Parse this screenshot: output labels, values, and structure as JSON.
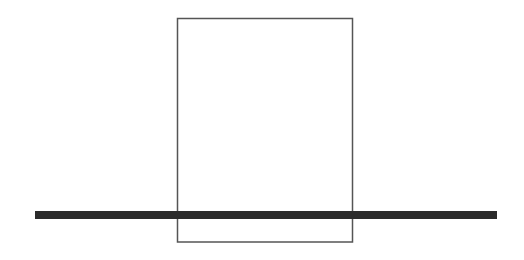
{
  "canvas": {
    "width": 524,
    "height": 260,
    "background": "#ffffff"
  },
  "shapes": {
    "rectangle": {
      "x": 177.5,
      "y": 18.5,
      "width": 175,
      "height": 223.5,
      "stroke": "#555555",
      "stroke_width": 1.5,
      "fill": "none"
    },
    "bar": {
      "x": 35,
      "y": 211,
      "width": 462,
      "height": 8,
      "fill": "#2b2b2b"
    }
  }
}
